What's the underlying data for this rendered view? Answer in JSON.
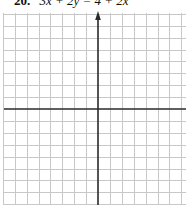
{
  "problem": {
    "number": "20.",
    "equation": "3x + 2y = 4 + 2x"
  },
  "graph": {
    "grid_color": "#c8c8c8",
    "axis_color": "#2a2a2a",
    "origin": {
      "x": 98,
      "y": 109
    },
    "spacing": 11.9,
    "grid_left": 4,
    "grid_top": 13,
    "cols_left": 8,
    "cols_right": 8,
    "rows_up": 8,
    "rows_down": 8,
    "y_axis_arrow": true,
    "x_axis_arrow": false
  }
}
